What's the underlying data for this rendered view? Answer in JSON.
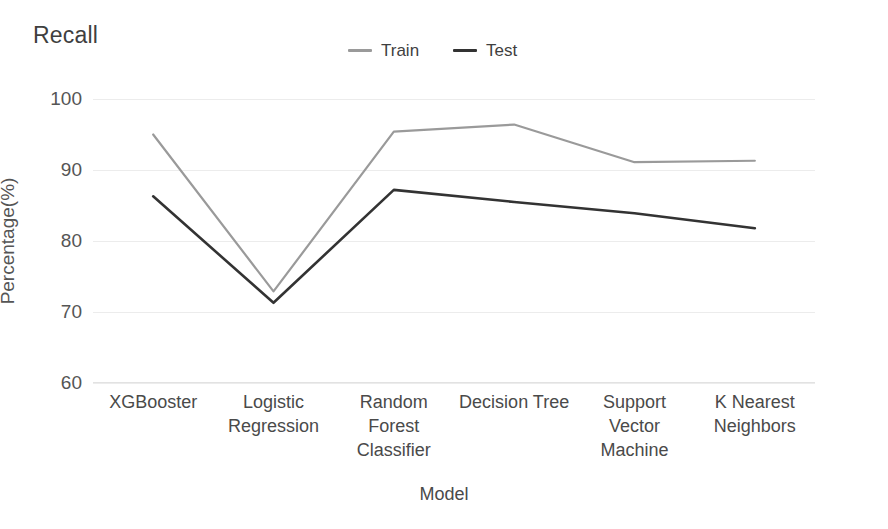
{
  "chart_data": {
    "type": "line",
    "title": "Recall",
    "xlabel": "Model",
    "ylabel": "Percentage(%)",
    "categories": [
      "XGBooster",
      "Logistic\nRegression",
      "Random\nForest\nClassifier",
      "Decision Tree",
      "Support\nVector\nMachine",
      "K Nearest\nNeighbors"
    ],
    "series": [
      {
        "name": "Train",
        "color": "#9a9a9a",
        "values": [
          95.0,
          72.9,
          95.4,
          96.4,
          91.1,
          91.3
        ]
      },
      {
        "name": "Test",
        "color": "#333333",
        "values": [
          86.3,
          71.3,
          87.2,
          85.5,
          83.9,
          81.8
        ]
      }
    ],
    "ylim": [
      60,
      100
    ],
    "yticks": [
      100,
      90,
      80,
      70,
      60
    ],
    "ytick_labels": [
      "100",
      "90",
      "80",
      "70",
      "60"
    ],
    "grid": true,
    "grid_color": "#ececec",
    "legend_position": "top-center",
    "background": "#ffffff"
  }
}
